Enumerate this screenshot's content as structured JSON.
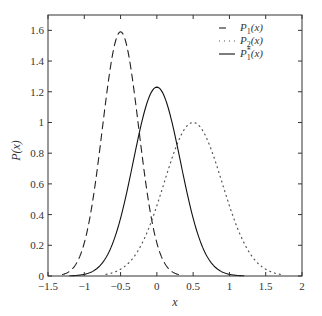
{
  "chart_data": {
    "type": "line",
    "title": "",
    "xlabel": "x",
    "ylabel": "P(x)",
    "xlim": [
      -1.5,
      2
    ],
    "ylim": [
      0,
      1.7
    ],
    "grid": false,
    "legend_position": "upper right",
    "xticks": [
      -1.5,
      -1,
      -0.5,
      0,
      0.5,
      1,
      1.5,
      2
    ],
    "xtick_labels": [
      "−1.5",
      "−1",
      "−0.5",
      "0",
      "0.5",
      "1",
      "1.5",
      "2"
    ],
    "yticks": [
      0,
      0.2,
      0.4,
      0.6,
      0.8,
      1,
      1.2,
      1.4,
      1.6
    ],
    "ytick_labels": [
      "0",
      "0.2",
      "0.4",
      "0.6",
      "0.8",
      "1",
      "1.2",
      "1.4",
      "1.6"
    ],
    "series": [
      {
        "name": "P1(x)",
        "legend_main": "P",
        "legend_sub": "1",
        "legend_sup": "",
        "legend_tail": "(x)",
        "style": "dashed",
        "color": "#222222",
        "mean": -0.5,
        "sigma": 0.25,
        "peak": 1.59,
        "x": [
          -1.3,
          -1.2,
          -1.1,
          -1.0,
          -0.9,
          -0.8,
          -0.7,
          -0.6,
          -0.5,
          -0.4,
          -0.3,
          -0.2,
          -0.1,
          0.0,
          0.1,
          0.2,
          0.3
        ],
        "y": [
          0.01,
          0.04,
          0.09,
          0.22,
          0.44,
          0.78,
          1.15,
          1.48,
          1.59,
          1.48,
          1.15,
          0.78,
          0.44,
          0.22,
          0.09,
          0.04,
          0.01
        ]
      },
      {
        "name": "P2(x)",
        "legend_main": "P",
        "legend_sub": "2",
        "legend_sup": "",
        "legend_tail": "(x)",
        "style": "dotted",
        "color": "#555555",
        "mean": 0.5,
        "sigma": 0.4,
        "peak": 1.0,
        "x": [
          -0.7,
          -0.5,
          -0.3,
          -0.1,
          0.0,
          0.1,
          0.2,
          0.3,
          0.4,
          0.5,
          0.6,
          0.7,
          0.8,
          0.9,
          1.0,
          1.1,
          1.3,
          1.5,
          1.7
        ],
        "y": [
          0.01,
          0.04,
          0.14,
          0.32,
          0.46,
          0.61,
          0.76,
          0.88,
          0.97,
          1.0,
          0.97,
          0.88,
          0.76,
          0.61,
          0.46,
          0.32,
          0.14,
          0.04,
          0.01
        ]
      },
      {
        "name": "P*1(x)",
        "legend_main": "P",
        "legend_sub": "1",
        "legend_sup": "*",
        "legend_tail": "(x)",
        "style": "solid",
        "color": "#111111",
        "mean": 0.0,
        "sigma": 0.325,
        "peak": 1.23,
        "x": [
          -1.2,
          -1.0,
          -0.9,
          -0.8,
          -0.7,
          -0.6,
          -0.5,
          -0.4,
          -0.3,
          -0.2,
          -0.1,
          0.0,
          0.1,
          0.2,
          0.3,
          0.4,
          0.5,
          0.6,
          0.7,
          0.8,
          0.9,
          1.0,
          1.2
        ],
        "y": [
          0.0,
          0.01,
          0.03,
          0.06,
          0.13,
          0.25,
          0.38,
          0.58,
          0.8,
          1.0,
          1.16,
          1.23,
          1.16,
          1.0,
          0.8,
          0.58,
          0.38,
          0.25,
          0.13,
          0.06,
          0.03,
          0.01,
          0.0
        ]
      }
    ]
  },
  "layout": {
    "plot_left": 48,
    "plot_right": 302,
    "plot_top": 15,
    "plot_bottom": 276
  }
}
